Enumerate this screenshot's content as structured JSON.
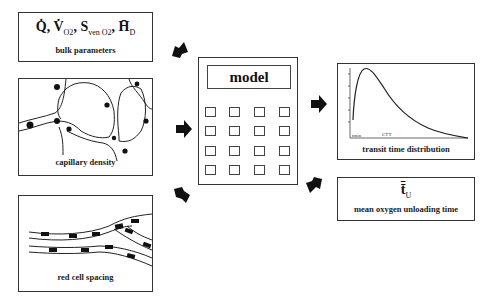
{
  "inputs": {
    "bulk_parameters": {
      "formula_parts": [
        "Q̇",
        "V̇",
        "O2",
        "S",
        "ven O2",
        "H̄",
        "D"
      ],
      "label": "bulk parameters"
    },
    "capillary_density": {
      "label": "capillary density"
    },
    "red_cell_spacing": {
      "label": "red cell spacing"
    }
  },
  "model": {
    "display_label": "model",
    "key_rows": 4,
    "key_columns": 4
  },
  "outputs": {
    "transit_time_distribution": {
      "label": "transit time distribution",
      "axis_marks": [
        "t_min",
        "CTT"
      ]
    },
    "mean_unloading_time": {
      "symbol": "t̄",
      "symbol_sub": "U",
      "label": "mean oxygen unloading time"
    }
  },
  "arrows": {
    "color": "#111111",
    "directions": [
      "in-from-bulk",
      "in-from-capillary",
      "out-to-capillary",
      "out-to-distribution",
      "in-from-mean-time"
    ]
  }
}
